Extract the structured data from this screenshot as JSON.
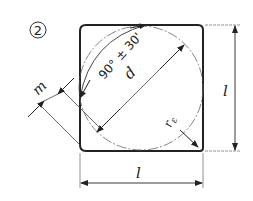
{
  "figure": {
    "number_label": "2",
    "dimensions": {
      "side_right": "l",
      "side_bottom": "l",
      "diameter": "d",
      "corner_offset": "m",
      "angle": "90° ± 30'",
      "corner_radius_base": "r",
      "corner_radius_sub": "ε"
    }
  },
  "colors": {
    "line": "#222222",
    "thin": "#444444",
    "background": "#ffffff"
  }
}
